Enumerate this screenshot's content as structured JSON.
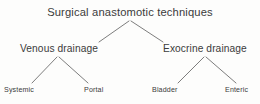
{
  "diagram": {
    "type": "tree",
    "title": "Surgical anastomotic techniques",
    "line_color": "#6e6e6e",
    "text_color": "#3b3b3b",
    "background_color": "#fdfdfc",
    "root": {
      "label": "Surgical anastomotic techniques"
    },
    "branches": [
      {
        "label": "Venous drainage"
      },
      {
        "label": "Exocrine drainage"
      }
    ],
    "leaves": [
      {
        "label": "Systemic",
        "parent": "Venous drainage"
      },
      {
        "label": "Portal",
        "parent": "Venous drainage"
      },
      {
        "label": "Bladder",
        "parent": "Exocrine drainage"
      },
      {
        "label": "Enteric",
        "parent": "Exocrine drainage"
      }
    ],
    "edges": [
      {
        "from": "Surgical anastomotic techniques",
        "to": "Venous drainage"
      },
      {
        "from": "Surgical anastomotic techniques",
        "to": "Exocrine drainage"
      },
      {
        "from": "Venous drainage",
        "to": "Systemic"
      },
      {
        "from": "Venous drainage",
        "to": "Portal"
      },
      {
        "from": "Exocrine drainage",
        "to": "Bladder"
      },
      {
        "from": "Exocrine drainage",
        "to": "Enteric"
      }
    ]
  }
}
